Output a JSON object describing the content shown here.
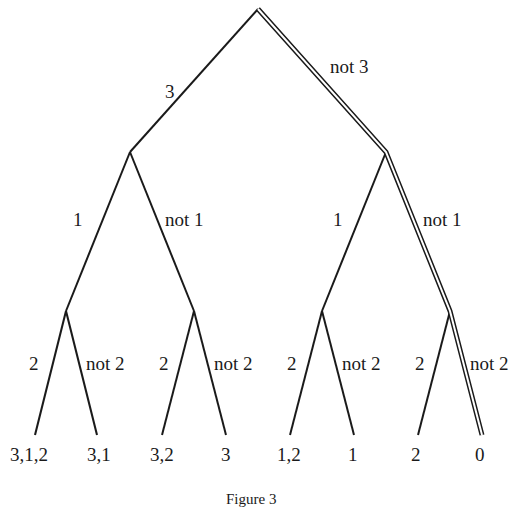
{
  "figure": {
    "caption": "Figure 3"
  },
  "levels": [
    {
      "yes": "3",
      "no": "not 3"
    },
    {
      "yes": "1",
      "no": "not 1"
    },
    {
      "yes": "2",
      "no": "not 2"
    }
  ],
  "edge_labels": {
    "root_left": "3",
    "root_right": "not 3",
    "l_left": "1",
    "l_right": "not 1",
    "r_left": "1",
    "r_right": "not 1",
    "ll_left": "2",
    "ll_right": "not 2",
    "lr_left": "2",
    "lr_right": "not 2",
    "rl_left": "2",
    "rl_right": "not 2",
    "rr_left": "2",
    "rr_right": "not 2"
  },
  "leaves": [
    "3,1,2",
    "3,1",
    "3,2",
    "3",
    "1,2",
    "1",
    "2",
    "0"
  ],
  "highlighted_path": [
    "not 3",
    "not 1",
    "not 2"
  ],
  "colors": {
    "ink": "#1a1a1a",
    "background": "#ffffff"
  }
}
